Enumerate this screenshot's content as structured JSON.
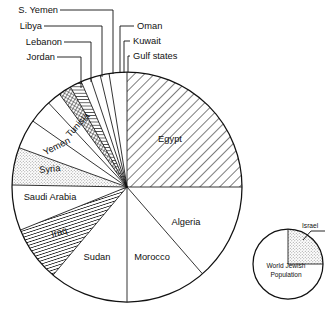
{
  "figure": {
    "type": "pie-chart-figure",
    "background": "#ffffff",
    "ink_color": "#111111"
  },
  "chart_data": {
    "type": "pie",
    "title": "",
    "subtitle": "",
    "xlabel": "",
    "ylabel": "",
    "grid": false,
    "legend_position": "callout-labels",
    "note": "Population shares of Arab states; thin wedges are labelled with leader lines above the circle.",
    "units": "share of total (percent)",
    "categories": [
      "Egypt",
      "Algeria",
      "Morocco",
      "Sudan",
      "Iraq",
      "Saudi Arabia",
      "Syria",
      "Yemen",
      "Tunisia",
      "Jordan",
      "Lebanon",
      "Libya",
      "S. Yemen",
      "Oman",
      "Kuwait",
      "Gulf states"
    ],
    "values": [
      25.0,
      13.6,
      11.4,
      11.1,
      7.8,
      6.4,
      5.3,
      4.2,
      3.3,
      1.9,
      1.9,
      1.7,
      1.4,
      1.4,
      1.1,
      1.5
    ],
    "slices": [
      {
        "label": "Egypt",
        "value": 25.0,
        "start_deg": 0.0,
        "end_deg": 90.0,
        "fill": "diagonal-hatch-medium",
        "label_placement": "inside",
        "label_x": 170,
        "label_y": 139
      },
      {
        "label": "Algeria",
        "value": 13.6,
        "start_deg": 90.0,
        "end_deg": 139.0,
        "fill": "white",
        "label_placement": "inside",
        "label_x": 185,
        "label_y": 222
      },
      {
        "label": "Morocco",
        "value": 11.4,
        "start_deg": 139.0,
        "end_deg": 180.0,
        "fill": "white",
        "label_placement": "inside",
        "label_x": 152,
        "label_y": 257
      },
      {
        "label": "Sudan",
        "value": 11.1,
        "start_deg": 180.0,
        "end_deg": 220.0,
        "fill": "white",
        "label_placement": "inside",
        "label_x": 97,
        "label_y": 257
      },
      {
        "label": "Iraq",
        "value": 7.8,
        "start_deg": 220.0,
        "end_deg": 248.0,
        "fill": "diagonal-hatch-dense",
        "label_placement": "inside",
        "label_x": 59,
        "label_y": 232
      },
      {
        "label": "Saudi Arabia",
        "value": 6.4,
        "start_deg": 248.0,
        "end_deg": 271.0,
        "fill": "white",
        "label_placement": "inside",
        "label_x": 48,
        "label_y": 197
      },
      {
        "label": "Syria",
        "value": 5.3,
        "start_deg": 271.0,
        "end_deg": 290.0,
        "fill": "stipple-light",
        "label_placement": "inside",
        "label_x": 49,
        "label_y": 170
      },
      {
        "label": "Yemen",
        "value": 4.2,
        "start_deg": 290.0,
        "end_deg": 305.0,
        "fill": "white",
        "label_placement": "inside",
        "label_x": 57,
        "label_y": 146
      },
      {
        "label": "Tunisia",
        "value": 3.3,
        "start_deg": 305.0,
        "end_deg": 317.0,
        "fill": "white",
        "label_placement": "inside",
        "label_x": 79,
        "label_y": 124
      },
      {
        "label": "Jordan",
        "value": 1.9,
        "start_deg": 317.0,
        "end_deg": 324.0,
        "fill": "white",
        "label_placement": "callout",
        "label_x": 58,
        "label_y": 58
      },
      {
        "label": "Lebanon",
        "value": 1.9,
        "start_deg": 324.0,
        "end_deg": 330.5,
        "fill": "crosshatch-dense",
        "label_placement": "callout",
        "label_x": 63,
        "label_y": 44
      },
      {
        "label": "Libya",
        "value": 1.7,
        "start_deg": 330.5,
        "end_deg": 336.5,
        "fill": "horizontal-hatch",
        "label_placement": "callout",
        "label_x": 55,
        "label_y": 29
      },
      {
        "label": "S. Yemen",
        "value": 1.4,
        "start_deg": 336.5,
        "end_deg": 341.5,
        "fill": "white",
        "label_placement": "callout",
        "label_x": 54,
        "label_y": 13
      },
      {
        "label": "Oman",
        "value": 1.4,
        "start_deg": 341.5,
        "end_deg": 346.5,
        "fill": "white",
        "label_placement": "callout",
        "label_x": 139,
        "label_y": 27
      },
      {
        "label": "Kuwait",
        "value": 1.1,
        "start_deg": 346.5,
        "end_deg": 351.0,
        "fill": "white",
        "label_placement": "callout",
        "label_x": 135,
        "label_y": 42
      },
      {
        "label": "Gulf states",
        "value": 1.5,
        "start_deg": 351.0,
        "end_deg": 360.0,
        "fill": "white",
        "label_placement": "callout",
        "label_x": 135,
        "label_y": 57
      }
    ],
    "inset": {
      "type": "pie",
      "title": "World Jewish Population",
      "title_line_1": "World Jewish",
      "title_line_2": "Population",
      "categories": [
        "Israel",
        "Diaspora"
      ],
      "values": [
        25.0,
        75.0
      ],
      "slices": [
        {
          "label": "Israel",
          "value": 25.0,
          "start_deg": 0.0,
          "end_deg": 90.0,
          "fill": "stipple-light",
          "label_placement": "callout"
        },
        {
          "label": "Diaspora",
          "value": 75.0,
          "start_deg": 90.0,
          "end_deg": 360.0,
          "fill": "white",
          "label_placement": "none"
        }
      ],
      "callout_label": "Israel"
    }
  },
  "geometry": {
    "main_center_x": 127,
    "main_center_y": 187,
    "main_radius": 115,
    "inset_center_x": 288,
    "inset_center_y": 264,
    "inset_radius": 35
  }
}
